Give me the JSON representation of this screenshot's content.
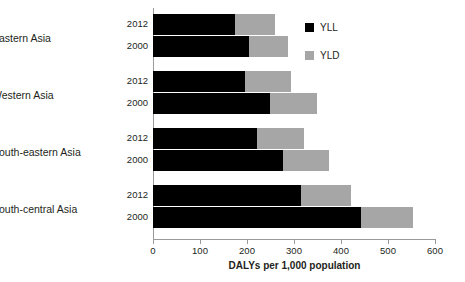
{
  "chart_data": {
    "type": "bar",
    "orientation": "horizontal",
    "stacked": true,
    "title": "",
    "xlabel": "DALYs per 1,000 population",
    "ylabel": "",
    "xlim": [
      0,
      600
    ],
    "xticks": [
      0,
      100,
      200,
      300,
      400,
      500,
      600
    ],
    "xtick_labels": [
      "0",
      "100",
      "200",
      "300",
      "400",
      "500",
      "600"
    ],
    "grid": false,
    "legend_position": "top-right",
    "legend": [
      "YLL",
      "YLD"
    ],
    "series": [
      {
        "name": "YLL",
        "color": "#000000"
      },
      {
        "name": "YLD",
        "color": "#a6a6a6"
      }
    ],
    "groups": [
      {
        "category": "Eastern Asia",
        "rows": [
          {
            "year": "2012",
            "YLL": 175,
            "YLD": 85,
            "total": 260
          },
          {
            "year": "2000",
            "YLL": 205,
            "YLD": 83,
            "total": 288
          }
        ]
      },
      {
        "category": "Western Asia",
        "rows": [
          {
            "year": "2012",
            "YLL": 195,
            "YLD": 98,
            "total": 293
          },
          {
            "year": "2000",
            "YLL": 248,
            "YLD": 100,
            "total": 348
          }
        ]
      },
      {
        "category": "South-eastern Asia",
        "rows": [
          {
            "year": "2012",
            "YLL": 222,
            "YLD": 100,
            "total": 322
          },
          {
            "year": "2000",
            "YLL": 277,
            "YLD": 98,
            "total": 375
          }
        ]
      },
      {
        "category": "South-central Asia",
        "rows": [
          {
            "year": "2012",
            "YLL": 315,
            "YLD": 107,
            "total": 422
          },
          {
            "year": "2000",
            "YLL": 443,
            "YLD": 110,
            "total": 553
          }
        ]
      }
    ]
  },
  "categories": [
    {
      "label": "Eastern Asia"
    },
    {
      "label": "Western Asia"
    },
    {
      "label": "South-eastern Asia"
    },
    {
      "label": "South-central Asia"
    }
  ],
  "years": [
    "2012",
    "2000"
  ],
  "legend": {
    "items": [
      {
        "label": "YLL",
        "color": "#000000",
        "icon": "square-swatch-black"
      },
      {
        "label": "YLD",
        "color": "#a6a6a6",
        "icon": "square-swatch-gray"
      }
    ]
  },
  "axis": {
    "x_title": "DALYs per 1,000 population",
    "ticks": [
      "0",
      "100",
      "200",
      "300",
      "400",
      "500",
      "600"
    ]
  }
}
